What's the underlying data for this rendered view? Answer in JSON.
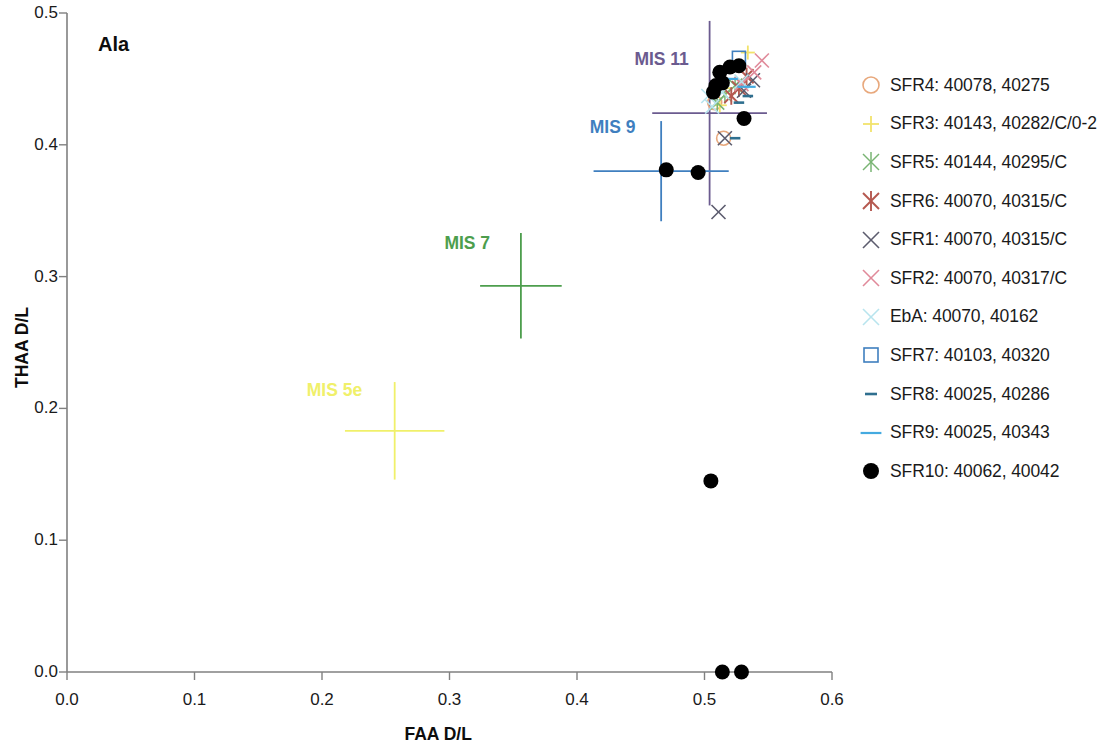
{
  "chart_data": {
    "type": "scatter",
    "title": "Ala",
    "xlabel": "FAA D/L",
    "ylabel": "THAA D/L",
    "xlim": [
      0.0,
      0.6
    ],
    "ylim": [
      0.0,
      0.5
    ],
    "xticks": [
      "0.0",
      "0.1",
      "0.2",
      "0.3",
      "0.4",
      "0.5",
      "0.6"
    ],
    "xtick_values": [
      0.0,
      0.1,
      0.2,
      0.3,
      0.4,
      0.5,
      0.6
    ],
    "yticks": [
      "0.0",
      "0.1",
      "0.2",
      "0.3",
      "0.4",
      "0.5"
    ],
    "ytick_values": [
      0.0,
      0.1,
      0.2,
      0.3,
      0.4,
      0.5
    ],
    "grid": false,
    "legend_position": "right",
    "series": [
      {
        "name": "SFR4: 40078, 40275",
        "marker": "circle-open",
        "color": "#e8a87c",
        "points": [
          [
            0.508,
            0.432
          ],
          [
            0.515,
            0.405
          ]
        ]
      },
      {
        "name": "SFR3: 40143, 40282/C/0-2",
        "marker": "plus",
        "color": "#f2e36b",
        "points": [
          [
            0.534,
            0.47
          ],
          [
            0.517,
            0.443
          ],
          [
            0.512,
            0.43
          ]
        ]
      },
      {
        "name": "SFR5: 40144, 40295/C",
        "marker": "asterisk",
        "color": "#79b473",
        "points": [
          [
            0.524,
            0.445
          ],
          [
            0.516,
            0.438
          ],
          [
            0.51,
            0.432
          ]
        ]
      },
      {
        "name": "SFR6: 40070, 40315/C",
        "marker": "asterisk-bold",
        "color": "#b5584f",
        "points": [
          [
            0.533,
            0.452
          ],
          [
            0.527,
            0.443
          ],
          [
            0.521,
            0.437
          ]
        ]
      },
      {
        "name": "SFR1: 40070, 40315/C",
        "marker": "cross",
        "color": "#5c5c6e",
        "points": [
          [
            0.538,
            0.449
          ],
          [
            0.531,
            0.441
          ],
          [
            0.516,
            0.405
          ],
          [
            0.511,
            0.349
          ]
        ]
      },
      {
        "name": "SFR2: 40070, 40317/C",
        "marker": "cross",
        "color": "#e08a9a",
        "points": [
          [
            0.545,
            0.464
          ],
          [
            0.539,
            0.455
          ],
          [
            0.529,
            0.446
          ]
        ]
      },
      {
        "name": "EbA: 40070, 40162",
        "marker": "cross",
        "color": "#b8e4ee",
        "points": [
          [
            0.529,
            0.448
          ],
          [
            0.514,
            0.44
          ],
          [
            0.506,
            0.429
          ],
          [
            0.503,
            0.437
          ]
        ]
      },
      {
        "name": "SFR7: 40103, 40320",
        "marker": "square-open",
        "color": "#3f7fbf",
        "points": [
          [
            0.527,
            0.466
          ]
        ]
      },
      {
        "name": "SFR8: 40025, 40286",
        "marker": "dash-short",
        "color": "#2f6f8f",
        "points": [
          [
            0.534,
            0.437
          ],
          [
            0.527,
            0.432
          ],
          [
            0.524,
            0.405
          ]
        ]
      },
      {
        "name": "SFR9: 40025, 40343",
        "marker": "dash-long",
        "color": "#44aae0",
        "points": [
          [
            0.533,
            0.444
          ],
          [
            0.519,
            0.45
          ]
        ]
      },
      {
        "name": "SFR10: 40062, 40042",
        "marker": "circle-filled",
        "color": "#000000",
        "points": [
          [
            0.512,
            0.455
          ],
          [
            0.52,
            0.459
          ],
          [
            0.527,
            0.46
          ],
          [
            0.509,
            0.445
          ],
          [
            0.514,
            0.447
          ],
          [
            0.507,
            0.44
          ],
          [
            0.531,
            0.42
          ],
          [
            0.47,
            0.381
          ],
          [
            0.495,
            0.379
          ],
          [
            0.505,
            0.145
          ],
          [
            0.514,
            0.0
          ],
          [
            0.529,
            0.0
          ]
        ]
      }
    ],
    "annotations": [
      {
        "label": "MIS 11",
        "color": "#6b5b8f",
        "x": 0.504,
        "y": 0.424,
        "xerr": 0.045,
        "yerr": 0.07,
        "label_x": 0.445,
        "label_y": 0.464
      },
      {
        "label": "MIS 9",
        "color": "#3f7fbf",
        "x": 0.466,
        "y": 0.38,
        "xerr": 0.053,
        "yerr": 0.038,
        "label_x": 0.41,
        "label_y": 0.413
      },
      {
        "label": "MIS 7",
        "color": "#4d9e4d",
        "x": 0.356,
        "y": 0.293,
        "xerr": 0.032,
        "yerr": 0.04,
        "label_x": 0.296,
        "label_y": 0.325
      },
      {
        "label": "MIS 5e",
        "color": "#f0f06a",
        "x": 0.257,
        "y": 0.183,
        "xerr": 0.039,
        "yerr": 0.037,
        "label_x": 0.188,
        "label_y": 0.213
      }
    ]
  },
  "legend": {
    "items": [
      {
        "label": "SFR4: 40078, 40275",
        "marker": "circle-open",
        "color": "#e8a87c"
      },
      {
        "label": "SFR3: 40143, 40282/C/0-2",
        "marker": "plus",
        "color": "#f2e36b"
      },
      {
        "label": "SFR5: 40144, 40295/C",
        "marker": "asterisk",
        "color": "#79b473"
      },
      {
        "label": "SFR6: 40070, 40315/C",
        "marker": "asterisk-bold",
        "color": "#b5584f"
      },
      {
        "label": "SFR1: 40070, 40315/C",
        "marker": "cross",
        "color": "#5c5c6e"
      },
      {
        "label": "SFR2: 40070, 40317/C",
        "marker": "cross",
        "color": "#e08a9a"
      },
      {
        "label": "EbA: 40070, 40162",
        "marker": "cross",
        "color": "#b8e4ee"
      },
      {
        "label": "SFR7: 40103, 40320",
        "marker": "square-open",
        "color": "#3f7fbf"
      },
      {
        "label": "SFR8: 40025, 40286",
        "marker": "dash-short",
        "color": "#2f6f8f"
      },
      {
        "label": "SFR9: 40025, 40343",
        "marker": "dash-long",
        "color": "#44aae0"
      },
      {
        "label": "SFR10: 40062, 40042",
        "marker": "circle-filled",
        "color": "#000000"
      }
    ]
  },
  "axis_style": {
    "line_color": "#808080"
  }
}
